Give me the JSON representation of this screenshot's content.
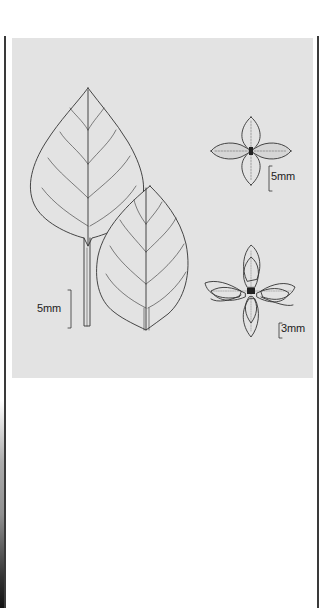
{
  "page": {
    "background": "#ffffff",
    "panel_color": "#e3e3e3",
    "line_color": "#333333"
  },
  "figure": {
    "scale_bars": {
      "main_leaf": "5mm",
      "four_leaf_rosette": "5mm",
      "dense_rosette": "3mm"
    }
  }
}
